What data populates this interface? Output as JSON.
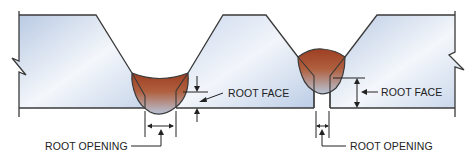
{
  "diagram": {
    "colors": {
      "plate_light": "#f3f6fb",
      "plate_dark": "#b9c9e2",
      "outline": "#3a3a3a",
      "weld_top": "#a44a2a",
      "weld_bottom": "#b9c3d4"
    },
    "labels": {
      "left_root_face": "ROOT FACE",
      "left_root_opening": "ROOT OPENING",
      "right_root_face": "ROOT FACE",
      "right_root_opening": "ROOT OPENING"
    },
    "joints": [
      {
        "name": "left-joint",
        "type": "single-V groove with wide root opening"
      },
      {
        "name": "right-joint",
        "type": "single-V groove with narrow root opening"
      }
    ]
  }
}
